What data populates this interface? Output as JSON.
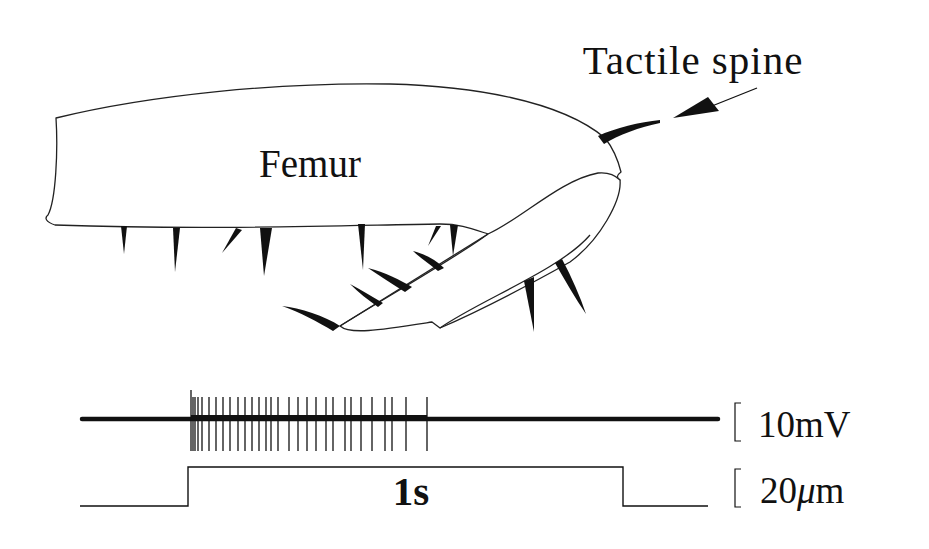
{
  "figure": {
    "labels": {
      "femur": "Femur",
      "tactile_spine": "Tactile spine",
      "time_scale": "1s",
      "voltage_scale": "10mV",
      "displacement_scale_value": "20",
      "displacement_scale_mu": "μ",
      "displacement_scale_unit": "m"
    },
    "colors": {
      "ink": "#111111",
      "background": "#ffffff"
    },
    "recording": {
      "baseline_x_start": 82,
      "baseline_x_end": 718,
      "baseline_y": 419,
      "spike_x_positions": [
        191,
        193,
        195,
        198,
        202,
        209,
        216,
        223,
        230,
        238,
        245,
        252,
        259,
        266,
        271,
        278,
        289,
        298,
        307,
        316,
        326,
        333,
        345,
        351,
        361,
        372,
        385,
        392,
        406,
        427
      ]
    },
    "stimulus": {
      "low_y": 506,
      "high_y": 467,
      "x_start": 80,
      "step_on_x": 188,
      "step_off_x": 623,
      "x_end": 708
    }
  }
}
